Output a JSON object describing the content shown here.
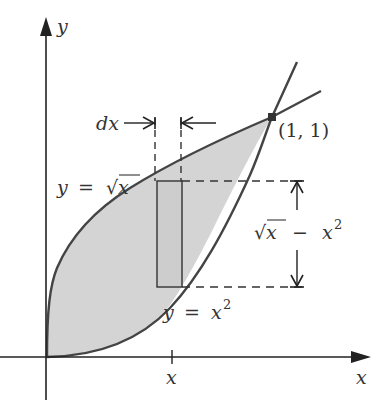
{
  "diagram": {
    "colors": {
      "axis": "#222222",
      "curve": "#444444",
      "fill": "#d4d4d4",
      "text": "#333333",
      "background": "#ffffff"
    },
    "axes": {
      "x_label": "x",
      "y_label": "y",
      "x_tick_label": "x"
    },
    "curves": [
      {
        "name": "sqrt",
        "label_y": "y",
        "label_eq": "=",
        "label_fn": "√x"
      },
      {
        "name": "square",
        "label_y": "y",
        "label_eq": "=",
        "label_base": "x",
        "label_exp": "2"
      }
    ],
    "intersection": {
      "label": "(1, 1)"
    },
    "strip": {
      "width_label": "dx",
      "height_label_sqrt": "√x",
      "height_label_minus": "−",
      "height_label_base": "x",
      "height_label_exp": "2"
    }
  }
}
